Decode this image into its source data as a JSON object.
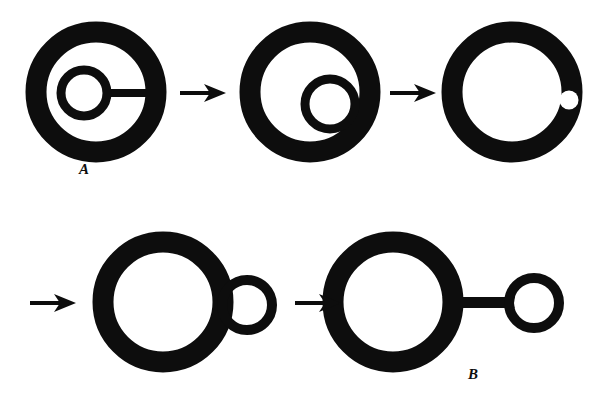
{
  "figure": {
    "background_color": "#ffffff",
    "ink_color": "#0d0d0d",
    "width": 595,
    "height": 409,
    "labels": [
      {
        "name": "stage-label-a",
        "text": "A",
        "x": 79,
        "y": 161
      },
      {
        "name": "stage-label-b",
        "text": "B",
        "x": 468,
        "y": 366
      }
    ],
    "rows": [
      {
        "name": "top-row",
        "panels": [
          {
            "name": "panel-1",
            "description": "large ring with small concentric ring inside connected by horizontal bar to the right wall",
            "outer_ring": {
              "cx": 96,
              "cy": 92,
              "r": 60,
              "stroke_width": 21
            },
            "inner_ring": {
              "cx": 84,
              "cy": 93,
              "r": 23,
              "stroke_width": 9
            },
            "connector_bar": {
              "x1": 105,
              "y1": 93,
              "x2": 150,
              "y2": 93,
              "thickness": 8
            }
          },
          {
            "name": "panel-2",
            "description": "large ring with small ring moved to lower right merging with outer wall",
            "outer_ring": {
              "cx": 310,
              "cy": 92,
              "r": 60,
              "stroke_width": 21
            },
            "inner_ring": {
              "cx": 330,
              "cy": 104,
              "r": 25,
              "stroke_width": 9
            }
          },
          {
            "name": "panel-3",
            "description": "ring with small white circle embedded in right wall",
            "outer_ring": {
              "cx": 512,
              "cy": 92,
              "r": 60,
              "stroke_width": 21
            },
            "white_dot": {
              "cx": 569,
              "cy": 100,
              "r": 9
            }
          }
        ]
      },
      {
        "name": "bottom-row",
        "panels": [
          {
            "name": "panel-4",
            "description": "large ring with small ring tangent externally on the right",
            "outer_ring": {
              "cx": 163,
              "cy": 302,
              "r": 60,
              "stroke_width": 21
            },
            "bud_ring": {
              "cx": 247,
              "cy": 305,
              "r": 25,
              "stroke_width": 10
            }
          },
          {
            "name": "panel-5",
            "description": "large ring joined by horizontal bar to a detached small ring",
            "outer_ring": {
              "cx": 393,
              "cy": 302,
              "r": 60,
              "stroke_width": 21
            },
            "bud_ring": {
              "cx": 534,
              "cy": 303,
              "r": 25,
              "stroke_width": 10
            },
            "connector_bar": {
              "x1": 450,
              "y1": 303,
              "x2": 512,
              "y2": 303,
              "thickness": 11
            }
          }
        ]
      }
    ],
    "arrows": [
      {
        "name": "arrow-1",
        "from_panel": "panel-1",
        "to_panel": "panel-2",
        "x": 180,
        "y": 93,
        "length": 44
      },
      {
        "name": "arrow-2",
        "from_panel": "panel-2",
        "to_panel": "panel-3",
        "x": 390,
        "y": 93,
        "length": 44
      },
      {
        "name": "arrow-3",
        "from_panel": "panel-3",
        "to_panel": "panel-4",
        "x": 30,
        "y": 303,
        "length": 44
      },
      {
        "name": "arrow-4",
        "from_panel": "panel-4",
        "to_panel": "panel-5",
        "x": 295,
        "y": 303,
        "length": 44
      }
    ]
  }
}
